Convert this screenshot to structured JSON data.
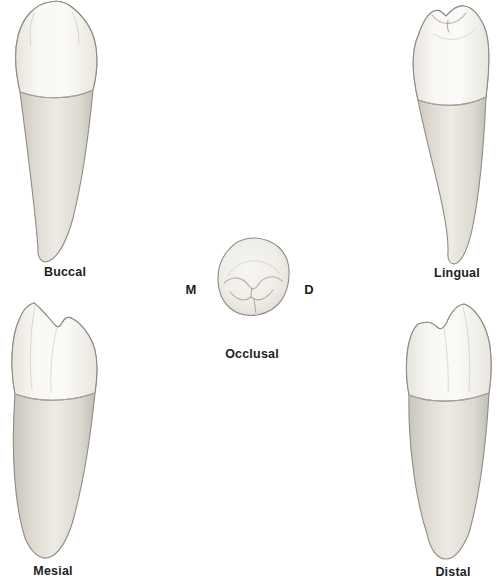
{
  "figure": {
    "views": {
      "buccal": {
        "label": "Buccal"
      },
      "lingual": {
        "label": "Lingual"
      },
      "occlusal": {
        "label": "Occlusal",
        "mesial_marker": "M",
        "distal_marker": "D"
      },
      "mesial": {
        "label": "Mesial"
      },
      "distal": {
        "label": "Distal"
      }
    },
    "colors": {
      "background": "#ffffff",
      "tooth_outline": "#8f8c84",
      "crown_fill": "#f8f7f3",
      "root_fill": "#e6e3db",
      "label_text": "#1e1e1e"
    }
  }
}
